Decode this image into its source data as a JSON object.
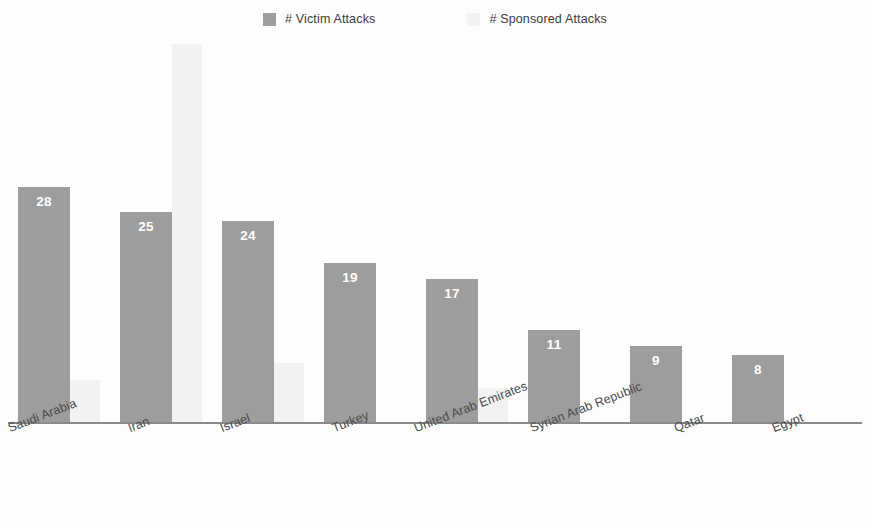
{
  "legend": {
    "position": "top-center",
    "entries": [
      {
        "label": "# Victim Attacks",
        "color": "#9d9d9d",
        "swatch_name": "legend-swatch-victim"
      },
      {
        "label": "# Sponsored Attacks",
        "color": "#f2f2f2",
        "swatch_name": "legend-swatch-sponsored"
      }
    ]
  },
  "chart_data": {
    "type": "bar",
    "title": "",
    "subtitle": "",
    "xlabel": "",
    "ylabel": "",
    "grid": false,
    "legend_position": "top-center",
    "axis_visible": {
      "x": true,
      "y": false
    },
    "ylim": [
      0,
      46
    ],
    "label_rotation_deg": -21,
    "categories": [
      "Saudi Arabia",
      "Iran",
      "Israel",
      "Turkey",
      "United Arab Emirates",
      "Syrian Arab Republic",
      "Qatar",
      "Egypt"
    ],
    "series": [
      {
        "name": "# Victim Attacks",
        "color": "#9d9d9d",
        "labels_shown": true,
        "values": [
          28,
          25,
          24,
          19,
          17,
          11,
          9,
          8
        ]
      },
      {
        "name": "# Sponsored Attacks",
        "color": "#f2f2f2",
        "labels_shown": false,
        "values": [
          5,
          45,
          7,
          0,
          4,
          0,
          0,
          0
        ]
      }
    ]
  }
}
